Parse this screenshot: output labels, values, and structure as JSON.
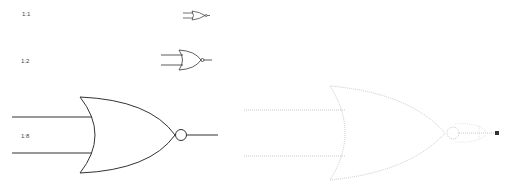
{
  "scale_labels": [
    {
      "text": "1:1",
      "x": 22,
      "y": 11
    },
    {
      "text": "1:2",
      "x": 21,
      "y": 58
    },
    {
      "text": "1:8",
      "x": 21,
      "y": 133
    }
  ],
  "gates": [
    {
      "type": "NOR",
      "scale": "1:1",
      "style": "solid"
    },
    {
      "type": "NOR",
      "scale": "1:2",
      "style": "solid"
    },
    {
      "type": "NOR",
      "scale": "1:8",
      "style": "solid"
    },
    {
      "type": "NOR",
      "scale": "1:8",
      "style": "dotted-outline"
    }
  ],
  "colors": {
    "stroke": "#333333",
    "dotted": "#bbbbbb",
    "endpoint": "#333333"
  }
}
